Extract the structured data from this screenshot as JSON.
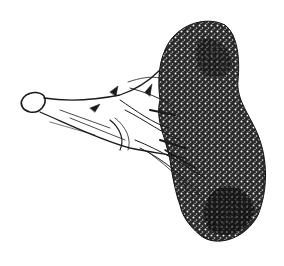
{
  "image": {
    "subject": "broccoli",
    "style": "pen-and-ink drawing",
    "background": "#ffffff",
    "ink": "#1a1a1a",
    "caption": ""
  }
}
